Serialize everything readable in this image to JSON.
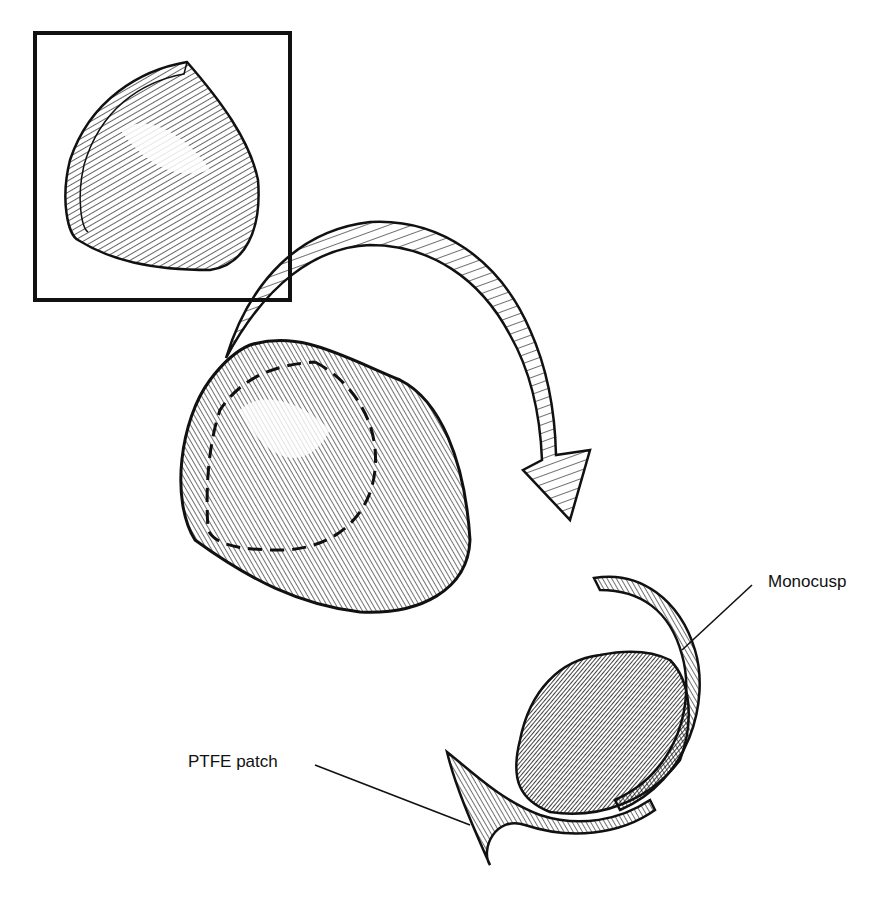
{
  "figure": {
    "labels": {
      "monocusp": "Monocusp",
      "ptfe_patch": "PTFE patch"
    },
    "elements": {
      "inset": "flat PTFE patch (inset box)",
      "arrow": "curved folding arrow",
      "shaped_patch": "shaped patch with dashed cut line",
      "result": "monocusp sewn into outflow tract"
    },
    "colors": {
      "ink": "#111111",
      "paper": "#ffffff"
    }
  }
}
